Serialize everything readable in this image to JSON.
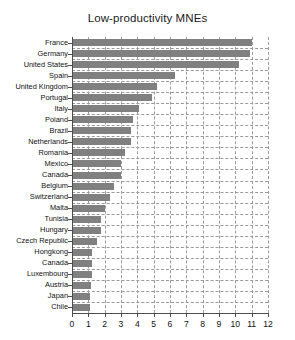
{
  "chart_data": {
    "type": "bar",
    "orientation": "horizontal",
    "title": "Low-productivity MNEs",
    "xlabel": "",
    "ylabel": "",
    "xlim": [
      0,
      12
    ],
    "xticks": [
      0,
      1,
      2,
      3,
      4,
      5,
      6,
      7,
      8,
      9,
      10,
      11,
      12
    ],
    "grid": "dashed",
    "legend": "none",
    "bar_color": "#808080",
    "grid_color": "#9a9a9a",
    "axis_color": "#4d4d4d",
    "background": "#ffffff",
    "categories": [
      "France",
      "Germany",
      "United States",
      "Spain",
      "United Kingdom",
      "Portugal",
      "Italy",
      "Poland",
      "Brazil",
      "Netherlands",
      "Romania",
      "Mexico",
      "Canada",
      "Belgium",
      "Switzerland",
      "Malta",
      "Tunisia",
      "Hungary",
      "Czech Republic",
      "Hongkong",
      "Canada",
      "Luxembourg",
      "Austria",
      "Japan",
      "Chile"
    ],
    "values": [
      11.0,
      10.9,
      10.25,
      6.3,
      5.2,
      4.9,
      4.1,
      3.75,
      3.6,
      3.6,
      3.25,
      3.0,
      3.0,
      2.6,
      2.35,
      2.0,
      1.8,
      1.75,
      1.5,
      1.25,
      1.2,
      1.2,
      1.15,
      1.1,
      1.1
    ]
  }
}
